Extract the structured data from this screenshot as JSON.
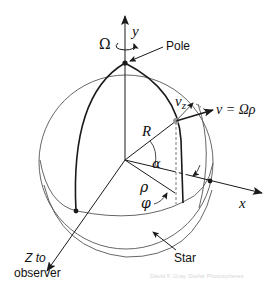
{
  "diagram": {
    "labels": {
      "y_axis": "y",
      "x_axis": "x",
      "z_axis_line1": "Z  to",
      "z_axis_line2": "observer",
      "omega": "Ω",
      "pole": "Pole",
      "star": "Star",
      "radius": "R",
      "alpha": "α",
      "rho": "ρ",
      "phi": "φ",
      "vz": "v",
      "vz_sub": "z",
      "velocity": "v = Ωρ"
    },
    "watermark": "David F. Gray Stellar Photospheres",
    "colors": {
      "line": "#1a1a1a",
      "thin_line": "#555555",
      "point_gray": "#9a9a9a",
      "background": "#ffffff",
      "watermark": "#d8d8d8"
    }
  }
}
